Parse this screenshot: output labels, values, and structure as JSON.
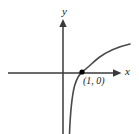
{
  "figure": {
    "title": "",
    "background_color": "#ffffff",
    "width": 139,
    "height": 134
  },
  "axes": {
    "x_label": "x",
    "y_label": "y",
    "axis_color": "#3a3a3a",
    "x_axis": {
      "y_pixel": 73,
      "x_start": 8,
      "x_end": 120,
      "arrow": "right"
    },
    "y_axis": {
      "x_pixel": 63,
      "y_start": 20,
      "y_end": 134,
      "arrow": "up"
    }
  },
  "curve": {
    "color": "#4a4a4a",
    "stroke_width": 1.6,
    "path": "M 69.5 134 C 70.2 116 71.5 98 74.5 86 C 77.5 76.5 80 73.5 82 72 C 88 67.6 93 62.2 99 57.5 C 107 51.6 117 47 130 44"
  },
  "marked_point": {
    "label": "(1, 0)",
    "x_pixel": 82,
    "y_pixel": 72,
    "radius": 2.6,
    "color": "#000000"
  },
  "chart_data": {
    "type": "line",
    "title": "",
    "xlabel": "x",
    "ylabel": "y",
    "grid": false,
    "legend": null,
    "series": [
      {
        "name": "y = log(x)",
        "description": "Logarithmic curve with vertical asymptote at x = 0, increasing and concave down, crossing the x-axis at (1, 0)",
        "x": [
          0.06,
          0.1,
          0.2,
          0.35,
          0.5,
          0.7,
          1.0,
          1.5,
          2.2,
          3.0,
          4.2,
          6.0,
          8.5
        ],
        "y": [
          -2.8,
          -2.3,
          -1.6,
          -1.05,
          -0.69,
          -0.36,
          0.0,
          0.41,
          0.79,
          1.1,
          1.44,
          1.79,
          2.14
        ]
      }
    ],
    "annotations": [
      {
        "text": "(1, 0)",
        "x": 1.0,
        "y": 0.0
      }
    ],
    "xlim": [
      -3.4,
      9.6
    ],
    "ylim": [
      -4.3,
      3.6
    ],
    "asymptote": {
      "type": "vertical",
      "x": 0
    }
  }
}
